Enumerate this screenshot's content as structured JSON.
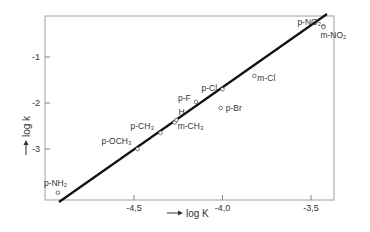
{
  "chart_data": {
    "type": "scatter",
    "title": "",
    "xlabel": "log K",
    "ylabel": "log k",
    "xlim": [
      -5.0,
      -3.35
    ],
    "ylim": [
      -4.0,
      -0.05
    ],
    "xticks": [
      -4.5,
      -4.0,
      -3.5
    ],
    "xtick_labels": [
      "-4,5",
      "-4,0",
      "-3,5"
    ],
    "yticks": [
      -1,
      -2,
      -3
    ],
    "ytick_labels": [
      "-1",
      "-2",
      "-3"
    ],
    "grid": false,
    "legend": null,
    "points": [
      {
        "label": "p-NH₂",
        "x": -4.93,
        "y": -3.95
      },
      {
        "label": "p-OCH₃",
        "x": -4.48,
        "y": -3.0
      },
      {
        "label": "p-CH₃",
        "x": -4.35,
        "y": -2.65
      },
      {
        "label": "m-CH₃",
        "x": -4.27,
        "y": -2.42
      },
      {
        "label": "H",
        "x": -4.26,
        "y": -2.37
      },
      {
        "label": "p-F",
        "x": -4.15,
        "y": -1.98
      },
      {
        "label": "p-Cl",
        "x": -4.0,
        "y": -1.7
      },
      {
        "label": "p-Br",
        "x": -4.01,
        "y": -2.11
      },
      {
        "label": "m-Cl",
        "x": -3.82,
        "y": -1.41
      },
      {
        "label": "p-NO₂",
        "x": -3.43,
        "y": -0.33
      },
      {
        "label": "m-NO₂",
        "x": -3.43,
        "y": -0.35
      }
    ],
    "fit_line": {
      "x": [
        -4.9,
        -3.35
      ],
      "y": [
        -4.0,
        0.0
      ]
    }
  },
  "axis": {
    "x_label_arrow": "→",
    "y_label_arrow": "→"
  }
}
